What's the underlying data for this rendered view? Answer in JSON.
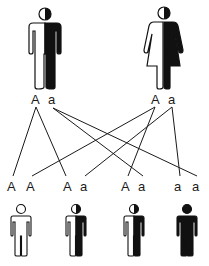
{
  "parents": [
    {
      "id": "father",
      "sex": "male",
      "genotype": [
        "A",
        "a"
      ],
      "phenotype": "carrier",
      "label_left": "A",
      "label_right": "a"
    },
    {
      "id": "mother",
      "sex": "female",
      "genotype": [
        "A",
        "a"
      ],
      "phenotype": "carrier",
      "label_left": "A",
      "label_right": "a"
    }
  ],
  "offspring": [
    {
      "genotype": [
        "A",
        "A"
      ],
      "phenotype": "unaffected",
      "label_left": "A",
      "label_right": "A"
    },
    {
      "genotype": [
        "A",
        "a"
      ],
      "phenotype": "carrier",
      "label_left": "A",
      "label_right": "a"
    },
    {
      "genotype": [
        "A",
        "a"
      ],
      "phenotype": "carrier",
      "label_left": "A",
      "label_right": "a"
    },
    {
      "genotype": [
        "a",
        "a"
      ],
      "phenotype": "affected",
      "label_left": "a",
      "label_right": "a"
    }
  ],
  "colors": {
    "line": "#1a1a1a",
    "fill_dark": "#111111",
    "fill_light": "#ffffff"
  }
}
